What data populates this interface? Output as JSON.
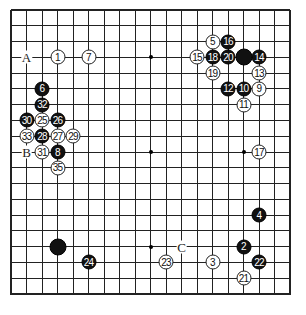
{
  "board": {
    "size": 19,
    "origin_x": 11,
    "origin_y": 10,
    "spacing_x": 15.5,
    "spacing_y": 15.78,
    "line_color": "#222222",
    "star_points": [
      [
        3,
        3
      ],
      [
        9,
        3
      ],
      [
        15,
        3
      ],
      [
        3,
        9
      ],
      [
        9,
        9
      ],
      [
        15,
        9
      ],
      [
        3,
        15
      ],
      [
        9,
        15
      ],
      [
        15,
        15
      ]
    ]
  },
  "stones": [
    {
      "col": 3,
      "row": 3,
      "color": "white",
      "label": "1"
    },
    {
      "col": 15,
      "row": 15,
      "color": "black",
      "label": "2"
    },
    {
      "col": 13,
      "row": 16,
      "color": "white",
      "label": "3"
    },
    {
      "col": 16,
      "row": 13,
      "color": "black",
      "label": "4"
    },
    {
      "col": 13,
      "row": 2,
      "color": "white",
      "label": "5"
    },
    {
      "col": 2,
      "row": 5,
      "color": "black",
      "label": "6"
    },
    {
      "col": 5,
      "row": 3,
      "color": "white",
      "label": "7"
    },
    {
      "col": 3,
      "row": 9,
      "color": "black",
      "label": "8"
    },
    {
      "col": 16,
      "row": 5,
      "color": "white",
      "label": "9"
    },
    {
      "col": 15,
      "row": 5,
      "color": "black",
      "label": "10"
    },
    {
      "col": 15,
      "row": 6,
      "color": "white",
      "label": "11"
    },
    {
      "col": 14,
      "row": 5,
      "color": "black",
      "label": "12"
    },
    {
      "col": 16,
      "row": 4,
      "color": "white",
      "label": "13"
    },
    {
      "col": 16,
      "row": 3,
      "color": "black",
      "label": "14"
    },
    {
      "col": 12,
      "row": 3,
      "color": "white",
      "label": "15"
    },
    {
      "col": 14,
      "row": 2,
      "color": "black",
      "label": "16"
    },
    {
      "col": 16,
      "row": 9,
      "color": "white",
      "label": "17"
    },
    {
      "col": 13,
      "row": 3,
      "color": "black",
      "label": "18"
    },
    {
      "col": 13,
      "row": 4,
      "color": "white",
      "label": "19"
    },
    {
      "col": 14,
      "row": 3,
      "color": "black",
      "label": "20"
    },
    {
      "col": 15,
      "row": 17,
      "color": "white",
      "label": "21"
    },
    {
      "col": 16,
      "row": 16,
      "color": "black",
      "label": "22"
    },
    {
      "col": 10,
      "row": 16,
      "color": "white",
      "label": "23"
    },
    {
      "col": 5,
      "row": 16,
      "color": "black",
      "label": "24"
    },
    {
      "col": 2,
      "row": 7,
      "color": "white",
      "label": "25"
    },
    {
      "col": 3,
      "row": 7,
      "color": "black",
      "label": "26"
    },
    {
      "col": 3,
      "row": 8,
      "color": "white",
      "label": "27"
    },
    {
      "col": 2,
      "row": 8,
      "color": "black",
      "label": "28"
    },
    {
      "col": 4,
      "row": 8,
      "color": "white",
      "label": "29"
    },
    {
      "col": 1,
      "row": 7,
      "color": "black",
      "label": "30"
    },
    {
      "col": 2,
      "row": 9,
      "color": "white",
      "label": "31"
    },
    {
      "col": 2,
      "row": 6,
      "color": "black",
      "label": "32"
    },
    {
      "col": 1,
      "row": 8,
      "color": "white",
      "label": "33"
    },
    {
      "col": 3,
      "row": 10,
      "color": "white",
      "label": "35"
    },
    {
      "col": 15,
      "row": 3,
      "color": "black",
      "label": ""
    },
    {
      "col": 3,
      "row": 15,
      "color": "black",
      "label": ""
    }
  ],
  "markers": [
    {
      "col": 1,
      "row": 3,
      "label": "A"
    },
    {
      "col": 1,
      "row": 9,
      "label": "B"
    },
    {
      "col": 11,
      "row": 15,
      "label": "C"
    }
  ]
}
